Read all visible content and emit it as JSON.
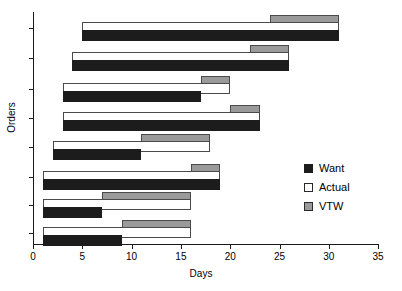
{
  "chart_data": {
    "type": "bar",
    "orientation": "horizontal",
    "title": "",
    "xlabel": "Days",
    "ylabel": "Orders",
    "xlim": [
      0,
      35
    ],
    "xticks": [
      0,
      5,
      10,
      15,
      20,
      25,
      30,
      35
    ],
    "grid": false,
    "legend_position": "right",
    "colors": {
      "want": "#1c1c1c",
      "actual": "#ffffff",
      "vtw": "#9a9a9a",
      "axis": "#1a1a1a",
      "background": "#ffffff"
    },
    "series": [
      {
        "name": "Want",
        "type": "span",
        "note": "black bar, lower of each group"
      },
      {
        "name": "Actual",
        "type": "span",
        "note": "white outlined bar, middle of each group"
      },
      {
        "name": "VTW",
        "type": "span",
        "note": "gray bar, upper right of each group"
      }
    ],
    "categories": [
      "Order 1",
      "Order 2",
      "Order 3",
      "Order 4",
      "Order 5",
      "Order 6",
      "Order 7",
      "Order 8"
    ],
    "groups": [
      {
        "order": "Order 1",
        "want": {
          "start": 5,
          "end": 31
        },
        "actual": {
          "start": 5,
          "end": 31
        },
        "vtw": {
          "start": 24,
          "end": 31
        }
      },
      {
        "order": "Order 2",
        "want": {
          "start": 4,
          "end": 26
        },
        "actual": {
          "start": 4,
          "end": 26
        },
        "vtw": {
          "start": 22,
          "end": 26
        }
      },
      {
        "order": "Order 3",
        "want": {
          "start": 3,
          "end": 17
        },
        "actual": {
          "start": 3,
          "end": 20
        },
        "vtw": {
          "start": 17,
          "end": 20
        }
      },
      {
        "order": "Order 4",
        "want": {
          "start": 3,
          "end": 23
        },
        "actual": {
          "start": 3,
          "end": 23
        },
        "vtw": {
          "start": 20,
          "end": 23
        }
      },
      {
        "order": "Order 5",
        "want": {
          "start": 2,
          "end": 11
        },
        "actual": {
          "start": 2,
          "end": 18
        },
        "vtw": {
          "start": 11,
          "end": 18
        }
      },
      {
        "order": "Order 6",
        "want": {
          "start": 1,
          "end": 19
        },
        "actual": {
          "start": 1,
          "end": 19
        },
        "vtw": {
          "start": 16,
          "end": 19
        }
      },
      {
        "order": "Order 7",
        "want": {
          "start": 1,
          "end": 7
        },
        "actual": {
          "start": 1,
          "end": 16
        },
        "vtw": {
          "start": 7,
          "end": 16
        }
      },
      {
        "order": "Order 8",
        "want": {
          "start": 1,
          "end": 9
        },
        "actual": {
          "start": 1,
          "end": 16
        },
        "vtw": {
          "start": 9,
          "end": 16
        }
      }
    ],
    "legend": [
      {
        "key": "want",
        "label": "Want"
      },
      {
        "key": "actual",
        "label": "Actual"
      },
      {
        "key": "vtw",
        "label": "VTW"
      }
    ]
  }
}
